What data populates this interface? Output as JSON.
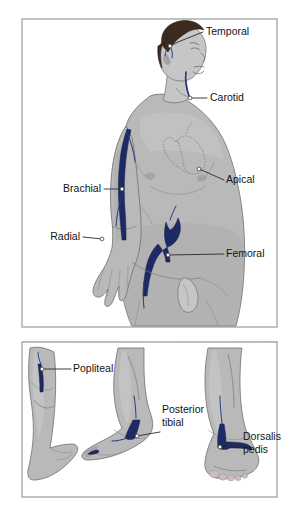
{
  "figure": {
    "panels": [
      {
        "id": "upper-panel",
        "description": "Male torso, head and arm with arterial pulse points",
        "labels": [
          {
            "id": "temporal",
            "text": "Temporal",
            "x": 206,
            "y": 35,
            "anchor": "start",
            "leader": [
              [
                203,
                32
              ],
              [
                178,
                42
              ],
              [
                170,
                46
              ]
            ],
            "dot": [
              170,
              46
            ]
          },
          {
            "id": "carotid",
            "text": "Carotid",
            "x": 210,
            "y": 101,
            "anchor": "start",
            "leader": [
              [
                207,
                98
              ],
              [
                190,
                98
              ]
            ],
            "dot": [
              190,
              98
            ]
          },
          {
            "id": "apical",
            "text": "Apical",
            "x": 226,
            "y": 183,
            "anchor": "start",
            "leader": [
              [
                224,
                180
              ],
              [
                206,
                172
              ],
              [
                199,
                169
              ]
            ],
            "dot": [
              199,
              169
            ]
          },
          {
            "id": "brachial",
            "text": "Brachial",
            "x": 101,
            "y": 192,
            "anchor": "end",
            "leader": [
              [
                104,
                189
              ],
              [
                122,
                189
              ]
            ],
            "dot": [
              122,
              189
            ]
          },
          {
            "id": "radial",
            "text": "Radial",
            "x": 80,
            "y": 240,
            "anchor": "end",
            "leader": [
              [
                83,
                237
              ],
              [
                102,
                239
              ]
            ],
            "dot": [
              102,
              239
            ]
          },
          {
            "id": "femoral",
            "text": "Femoral",
            "x": 226,
            "y": 257,
            "anchor": "start",
            "leader": [
              [
                224,
                254
              ],
              [
                168,
                255
              ]
            ],
            "dot": [
              168,
              255
            ]
          }
        ]
      },
      {
        "id": "lower-panel",
        "description": "Three leg and foot views with arterial pulse points",
        "labels": [
          {
            "id": "popliteal",
            "text": "Popliteal",
            "x": 73,
            "y": 372,
            "anchor": "start",
            "leader": [
              [
                71,
                369
              ],
              [
                42,
                369
              ]
            ],
            "dot": [
              42,
              369
            ]
          },
          {
            "id": "posterior-tibial",
            "text": "Posterior",
            "text2": "tibial",
            "x": 162,
            "y": 413,
            "anchor": "start",
            "leader": [
              [
                160,
                432
              ],
              [
                137,
                436
              ]
            ],
            "dot": [
              137,
              436
            ]
          },
          {
            "id": "dorsalis-pedis",
            "text": "Dorsalis",
            "text2": "pedis",
            "x": 243,
            "y": 440,
            "anchor": "start",
            "leader": [
              [
                241,
                447
              ],
              [
                220,
                447
              ]
            ],
            "dot": [
              220,
              447
            ]
          }
        ]
      }
    ],
    "gradient_strip": {
      "stops": [
        "#9fd4cf",
        "#a9d9a0",
        "#e8e3a0",
        "#f0c7cc",
        "#f39bb6"
      ]
    },
    "colors": {
      "artery": "#1d2a63",
      "skin": "#b9b9b9",
      "hair": "#3b2a20",
      "border": "#9b9b9b",
      "label_text": "#141414",
      "background": "#ffffff"
    }
  }
}
